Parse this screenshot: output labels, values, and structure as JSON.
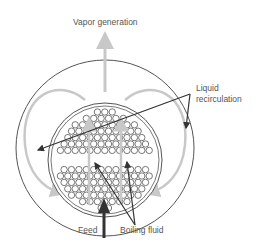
{
  "diagram": {
    "labels": {
      "vapor_generation": "Vapor generation",
      "liquid_recirculation_line1": "Liquid",
      "liquid_recirculation_line2": "recirculation",
      "feed": "Feed",
      "boiling_fluid": "Boiling fluid"
    },
    "colors": {
      "outline": "#555555",
      "flow_arrow": "#c8c8c8",
      "leader_line": "#333333",
      "feed_arrow": "#333333",
      "tube": "#555555"
    }
  }
}
